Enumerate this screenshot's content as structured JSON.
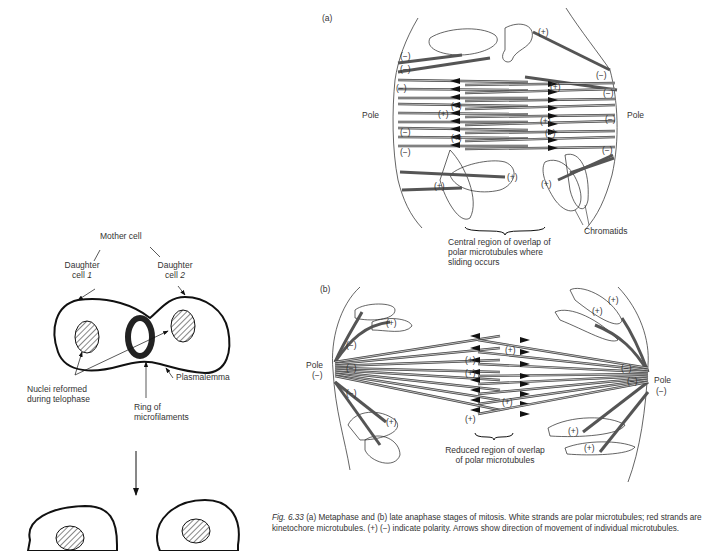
{
  "figure": {
    "panel_a": {
      "label": "(a)",
      "pole_left": "Pole",
      "pole_right": "Pole",
      "overlap_note": [
        "Central region of overlap of",
        "polar microtubules where",
        "sliding occurs"
      ],
      "chromatids": "Chromatids",
      "plus": "(+)",
      "minus": "(−)"
    },
    "panel_b": {
      "label": "(b)",
      "pole_left": "Pole",
      "pole_left_sign": "(−)",
      "pole_right": "Pole",
      "pole_right_sign": "(−)",
      "overlap_note": [
        "Reduced region of overlap",
        "of polar microtubules"
      ],
      "plus": "(+)",
      "minus": "(−)"
    },
    "cytokinesis": {
      "mother_cell": "Mother cell",
      "daughter1_a": "Daughter",
      "daughter1_b": "cell ",
      "daughter1_num": "1",
      "daughter2_a": "Daughter",
      "daughter2_b": "cell ",
      "daughter2_num": "2",
      "nuclei": [
        "Nuclei reformed",
        "during telophase"
      ],
      "ring": [
        "Ring of",
        "microfilaments"
      ],
      "plasmalemma": "Plasmalemma"
    },
    "caption": {
      "fig_no": "Fig. 6.33",
      "text": " (a) Metaphase and (b) late anaphase stages of mitosis. White strands are polar microtubules; red strands are kinetochore microtubules. (+) (−) indicate polarity. Arrows show direction of movement of individual microtubules."
    }
  }
}
